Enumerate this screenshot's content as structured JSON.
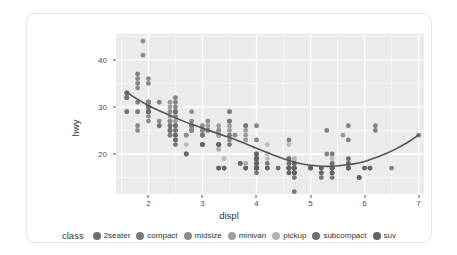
{
  "card": {
    "background": "#ffffff",
    "border_color": "#e6e6e6"
  },
  "chart_data": {
    "type": "scatter",
    "title": "",
    "subtitle": "",
    "xlabel": "displ",
    "ylabel": "hwy",
    "xlim": [
      1.4,
      7.1
    ],
    "ylim": [
      11.5,
      45.5
    ],
    "x_ticks": [
      2,
      3,
      4,
      5,
      6,
      7
    ],
    "y_ticks": [
      20,
      30,
      40
    ],
    "x_tick_labels": [
      "2",
      "3",
      "4",
      "5",
      "6",
      "7"
    ],
    "y_tick_labels": [
      "20",
      "30",
      "40"
    ],
    "grid": true,
    "grid_color": "#ffffff",
    "panel_background": "#ebebeb",
    "legend_position": "bottom",
    "legend_title": "class",
    "point_opacity": 0.85,
    "point_radius": 2.4,
    "series": [
      {
        "name": "2seater",
        "color": "#6e6e6e",
        "points": [
          [
            5.7,
            26
          ],
          [
            5.7,
            23
          ],
          [
            6.2,
            26
          ],
          [
            6.2,
            25
          ],
          [
            7.0,
            24
          ]
        ]
      },
      {
        "name": "compact",
        "color": "#7a7a7a",
        "points": [
          [
            1.8,
            29
          ],
          [
            1.8,
            29
          ],
          [
            2.0,
            31
          ],
          [
            2.0,
            30
          ],
          [
            2.8,
            26
          ],
          [
            2.8,
            26
          ],
          [
            3.1,
            27
          ],
          [
            1.8,
            26
          ],
          [
            1.8,
            25
          ],
          [
            2.0,
            28
          ],
          [
            2.0,
            27
          ],
          [
            2.8,
            25
          ],
          [
            2.8,
            25
          ],
          [
            3.1,
            25
          ],
          [
            3.1,
            25
          ],
          [
            2.4,
            27
          ],
          [
            2.4,
            25
          ],
          [
            2.5,
            26
          ],
          [
            2.5,
            23
          ],
          [
            3.3,
            22
          ],
          [
            2.0,
            29
          ],
          [
            2.0,
            29
          ],
          [
            2.0,
            31
          ],
          [
            2.0,
            31
          ],
          [
            2.8,
            26
          ],
          [
            1.6,
            33
          ],
          [
            1.6,
            32
          ],
          [
            1.6,
            32
          ],
          [
            1.6,
            29
          ],
          [
            1.6,
            32
          ],
          [
            1.8,
            34
          ],
          [
            1.8,
            36
          ],
          [
            2.0,
            36
          ],
          [
            2.5,
            29
          ],
          [
            2.5,
            26
          ],
          [
            1.9,
            44
          ],
          [
            2.0,
            29
          ],
          [
            2.0,
            29
          ],
          [
            2.0,
            29
          ],
          [
            2.5,
            29
          ],
          [
            2.8,
            29
          ],
          [
            1.9,
            41
          ],
          [
            2.0,
            31
          ],
          [
            2.5,
            29
          ],
          [
            2.8,
            27
          ],
          [
            2.2,
            26
          ],
          [
            2.2,
            27
          ],
          [
            2.4,
            26
          ],
          [
            2.4,
            25
          ],
          [
            3.0,
            24
          ],
          [
            3.0,
            25
          ],
          [
            3.5,
            23
          ]
        ]
      },
      {
        "name": "midsize",
        "color": "#8c8c8c",
        "points": [
          [
            2.4,
            31
          ],
          [
            2.4,
            30
          ],
          [
            3.1,
            26
          ],
          [
            3.5,
            26
          ],
          [
            2.4,
            27
          ],
          [
            2.4,
            26
          ],
          [
            3.0,
            25
          ],
          [
            3.0,
            24
          ],
          [
            3.5,
            27
          ],
          [
            3.5,
            25
          ],
          [
            2.4,
            29
          ],
          [
            2.4,
            27
          ],
          [
            2.5,
            28
          ],
          [
            2.5,
            25
          ],
          [
            3.3,
            25
          ],
          [
            2.0,
            30
          ],
          [
            2.0,
            31
          ],
          [
            2.4,
            28
          ],
          [
            2.4,
            29
          ],
          [
            3.3,
            26
          ],
          [
            3.8,
            26
          ],
          [
            3.8,
            25
          ],
          [
            2.5,
            28
          ],
          [
            2.5,
            27
          ],
          [
            2.8,
            25
          ],
          [
            2.8,
            25
          ],
          [
            3.6,
            24
          ],
          [
            3.0,
            26
          ],
          [
            3.3,
            25
          ],
          [
            3.8,
            23
          ],
          [
            3.8,
            24
          ],
          [
            4.0,
            23
          ],
          [
            3.5,
            29
          ],
          [
            3.5,
            27
          ],
          [
            3.6,
            24
          ],
          [
            2.7,
            24
          ],
          [
            2.7,
            24
          ],
          [
            3.0,
            26
          ],
          [
            3.0,
            25
          ],
          [
            3.3,
            24
          ],
          [
            3.3,
            22
          ],
          [
            4.0,
            23
          ],
          [
            5.6,
            24
          ]
        ]
      },
      {
        "name": "minivan",
        "color": "#a0a0a0",
        "points": [
          [
            2.4,
            24
          ],
          [
            3.0,
            22
          ],
          [
            3.3,
            24
          ],
          [
            3.3,
            24
          ],
          [
            3.3,
            17
          ],
          [
            3.3,
            22
          ],
          [
            3.3,
            21
          ],
          [
            3.8,
            23
          ],
          [
            3.8,
            18
          ],
          [
            3.8,
            17
          ],
          [
            4.0,
            17
          ]
        ]
      },
      {
        "name": "pickup",
        "color": "#b3b3b3",
        "points": [
          [
            2.7,
            20
          ],
          [
            2.7,
            22
          ],
          [
            3.4,
            17
          ],
          [
            3.4,
            19
          ],
          [
            4.0,
            20
          ],
          [
            4.0,
            17
          ],
          [
            4.7,
            17
          ],
          [
            4.7,
            19
          ],
          [
            4.7,
            19
          ],
          [
            5.7,
            19
          ],
          [
            6.1,
            17
          ],
          [
            4.0,
            19
          ],
          [
            4.2,
            19
          ],
          [
            4.4,
            17
          ],
          [
            4.6,
            19
          ],
          [
            5.4,
            19
          ],
          [
            5.4,
            17
          ],
          [
            5.4,
            18
          ],
          [
            4.0,
            17
          ],
          [
            4.0,
            19
          ],
          [
            4.6,
            17
          ],
          [
            5.0,
            17
          ],
          [
            4.2,
            20
          ],
          [
            4.2,
            22
          ],
          [
            4.6,
            17
          ],
          [
            4.6,
            19
          ],
          [
            4.6,
            19
          ],
          [
            4.6,
            22
          ],
          [
            5.4,
            20
          ],
          [
            5.4,
            17
          ],
          [
            4.0,
            18
          ],
          [
            4.0,
            19
          ],
          [
            4.6,
            18
          ]
        ]
      },
      {
        "name": "subcompact",
        "color": "#707070",
        "points": [
          [
            1.6,
            33
          ],
          [
            1.6,
            32
          ],
          [
            1.8,
            35
          ],
          [
            1.8,
            37
          ],
          [
            2.0,
            35
          ],
          [
            2.0,
            29
          ],
          [
            2.2,
            31
          ],
          [
            2.2,
            26
          ],
          [
            2.4,
            24
          ],
          [
            2.5,
            24
          ],
          [
            2.5,
            32
          ],
          [
            2.5,
            31
          ],
          [
            2.5,
            30
          ],
          [
            2.5,
            29
          ],
          [
            2.5,
            26
          ],
          [
            2.5,
            25
          ],
          [
            3.8,
            26
          ],
          [
            4.0,
            26
          ],
          [
            4.6,
            23
          ],
          [
            5.4,
            20
          ],
          [
            1.6,
            33
          ],
          [
            1.6,
            29
          ],
          [
            1.8,
            31
          ],
          [
            2.0,
            30
          ],
          [
            2.4,
            26
          ],
          [
            2.4,
            25
          ],
          [
            3.0,
            22
          ],
          [
            3.0,
            24
          ],
          [
            3.5,
            29
          ],
          [
            3.5,
            27
          ],
          [
            5.3,
            25
          ],
          [
            5.3,
            20
          ],
          [
            5.7,
            17
          ],
          [
            6.5,
            17
          ]
        ]
      },
      {
        "name": "suv",
        "color": "#636363",
        "points": [
          [
            4.2,
            17
          ],
          [
            4.2,
            17
          ],
          [
            4.6,
            16
          ],
          [
            4.6,
            17
          ],
          [
            4.6,
            17
          ],
          [
            4.6,
            17
          ],
          [
            5.4,
            16
          ],
          [
            5.4,
            17
          ],
          [
            5.4,
            16
          ],
          [
            4.0,
            17
          ],
          [
            4.0,
            18
          ],
          [
            4.0,
            17
          ],
          [
            4.0,
            18
          ],
          [
            4.6,
            17
          ],
          [
            4.6,
            18
          ],
          [
            5.0,
            17
          ],
          [
            4.0,
            20
          ],
          [
            4.0,
            19
          ],
          [
            4.0,
            20
          ],
          [
            4.7,
            15
          ],
          [
            4.7,
            17
          ],
          [
            4.7,
            17
          ],
          [
            5.2,
            16
          ],
          [
            5.2,
            16
          ],
          [
            5.7,
            17
          ],
          [
            5.9,
            15
          ],
          [
            4.7,
            18
          ],
          [
            4.7,
            18
          ],
          [
            5.2,
            17
          ],
          [
            5.7,
            18
          ],
          [
            5.9,
            15
          ],
          [
            4.6,
            19
          ],
          [
            5.4,
            18
          ],
          [
            5.4,
            17
          ],
          [
            3.3,
            17
          ],
          [
            3.3,
            17
          ],
          [
            4.0,
            17
          ],
          [
            4.0,
            19
          ],
          [
            4.0,
            19
          ],
          [
            4.6,
            17
          ],
          [
            4.6,
            17
          ],
          [
            5.0,
            17
          ],
          [
            2.5,
            23
          ],
          [
            2.5,
            24
          ],
          [
            2.5,
            22
          ],
          [
            3.5,
            22
          ],
          [
            3.5,
            24
          ],
          [
            3.0,
            22
          ],
          [
            3.0,
            22
          ],
          [
            3.3,
            22
          ],
          [
            3.3,
            22
          ],
          [
            3.7,
            18
          ],
          [
            3.7,
            18
          ],
          [
            4.0,
            19
          ],
          [
            4.0,
            19
          ],
          [
            4.7,
            16
          ],
          [
            4.7,
            17
          ],
          [
            4.7,
            17
          ],
          [
            5.7,
            19
          ],
          [
            6.1,
            17
          ],
          [
            4.0,
            17
          ],
          [
            4.2,
            18
          ],
          [
            4.4,
            17
          ],
          [
            4.6,
            16
          ],
          [
            5.4,
            16
          ],
          [
            5.4,
            17
          ],
          [
            5.4,
            15
          ],
          [
            4.0,
            16
          ],
          [
            4.0,
            17
          ],
          [
            4.6,
            17
          ],
          [
            5.0,
            17
          ],
          [
            6.0,
            17
          ],
          [
            6.0,
            17
          ],
          [
            4.7,
            12
          ],
          [
            4.7,
            16
          ],
          [
            4.7,
            16
          ],
          [
            5.2,
            17
          ],
          [
            5.2,
            15
          ],
          [
            5.7,
            17
          ],
          [
            5.9,
            15
          ],
          [
            3.8,
            17
          ],
          [
            3.8,
            17
          ],
          [
            4.0,
            17
          ],
          [
            4.0,
            18
          ],
          [
            4.0,
            17
          ],
          [
            4.6,
            17
          ],
          [
            5.4,
            17
          ],
          [
            5.4,
            17
          ],
          [
            2.7,
            20
          ],
          [
            2.7,
            20
          ],
          [
            3.4,
            17
          ],
          [
            3.4,
            17
          ],
          [
            4.0,
            17
          ],
          [
            4.7,
            16
          ],
          [
            5.7,
            18
          ],
          [
            6.1,
            17
          ]
        ]
      }
    ],
    "smooth": {
      "name": "loess",
      "color": "#555555",
      "line_width": 1.6,
      "points": [
        [
          1.6,
          33.1
        ],
        [
          1.8,
          31.6
        ],
        [
          2.0,
          30.3
        ],
        [
          2.2,
          29.2
        ],
        [
          2.4,
          28.2
        ],
        [
          2.6,
          27.2
        ],
        [
          2.8,
          26.3
        ],
        [
          3.0,
          25.5
        ],
        [
          3.2,
          24.7
        ],
        [
          3.4,
          23.9
        ],
        [
          3.6,
          23.1
        ],
        [
          3.8,
          22.2
        ],
        [
          4.0,
          21.2
        ],
        [
          4.2,
          20.3
        ],
        [
          4.4,
          19.4
        ],
        [
          4.6,
          18.6
        ],
        [
          4.8,
          18.0
        ],
        [
          5.0,
          17.6
        ],
        [
          5.2,
          17.4
        ],
        [
          5.4,
          17.4
        ],
        [
          5.6,
          17.6
        ],
        [
          5.8,
          17.9
        ],
        [
          6.0,
          18.4
        ],
        [
          6.2,
          19.2
        ],
        [
          6.4,
          20.1
        ],
        [
          6.6,
          21.2
        ],
        [
          6.8,
          22.5
        ],
        [
          7.0,
          24.0
        ]
      ]
    }
  },
  "legend": {
    "title": "class",
    "items": [
      {
        "label": "2seater",
        "color": "#6e6e6e"
      },
      {
        "label": "compact",
        "color": "#7a7a7a"
      },
      {
        "label": "midsize",
        "color": "#8c8c8c"
      },
      {
        "label": "minivan",
        "color": "#a0a0a0"
      },
      {
        "label": "pickup",
        "color": "#b3b3b3"
      },
      {
        "label": "subcompact",
        "color": "#707070"
      },
      {
        "label": "suv",
        "color": "#636363"
      }
    ]
  }
}
